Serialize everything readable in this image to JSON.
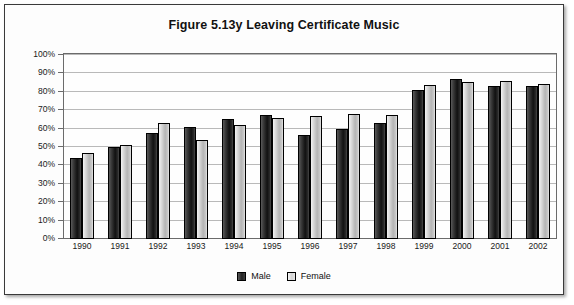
{
  "figure": {
    "title": "Figure 5.13y  Leaving Certificate Music",
    "frame_border_color": "#3a3a3a"
  },
  "legend": {
    "position": "bottom-center",
    "items": [
      {
        "label": "Male",
        "color": "#222222"
      },
      {
        "label": "Female",
        "color": "#d2d2d2"
      }
    ]
  },
  "axis": {
    "y_ticks": [
      "0%",
      "10%",
      "20%",
      "30%",
      "40%",
      "50%",
      "60%",
      "70%",
      "80%",
      "90%",
      "100%"
    ]
  },
  "chart_data": {
    "type": "bar",
    "title": "Figure 5.13y  Leaving Certificate Music",
    "xlabel": "",
    "ylabel": "",
    "ylim": [
      0,
      100
    ],
    "ytick_step": 10,
    "grid": true,
    "legend_position": "bottom-center",
    "categories": [
      "1990",
      "1991",
      "1992",
      "1993",
      "1994",
      "1995",
      "1996",
      "1997",
      "1998",
      "1999",
      "2000",
      "2001",
      "2002"
    ],
    "series": [
      {
        "name": "Male",
        "values": [
          44,
          50,
          57.5,
          61,
          65,
          67.5,
          56.5,
          60,
          63,
          81,
          87,
          83,
          83
        ]
      },
      {
        "name": "Female",
        "values": [
          47,
          51,
          63,
          54,
          62,
          66,
          67,
          68,
          67.5,
          83.5,
          85.5,
          86,
          84.5
        ]
      }
    ]
  }
}
